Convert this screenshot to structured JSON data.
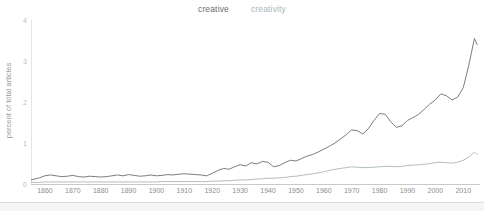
{
  "legend": {
    "position": "top-center",
    "items": [
      {
        "label": "creative",
        "color": "#6e6e6e"
      },
      {
        "label": "creativity",
        "color": "#a8b5b8"
      }
    ]
  },
  "axes": {
    "ylabel": "percent of total articles",
    "xlabel": "",
    "yticks": [
      "0",
      "1",
      "2",
      "3",
      "4"
    ],
    "xticks": [
      "1860",
      "1870",
      "1880",
      "1890",
      "1900",
      "1910",
      "1920",
      "1930",
      "1940",
      "1950",
      "1960",
      "1970",
      "1980",
      "1990",
      "2000",
      "2010"
    ]
  },
  "colors": {
    "creative": "#6e6e6e",
    "creativity": "#a8b5b8",
    "axis": "#c9c9c9",
    "gridline": "#e4e4e4",
    "tick_text": "#8d8d8d",
    "background": "#ffffff"
  },
  "chart_data": {
    "type": "line",
    "title": "",
    "xlabel": "",
    "ylabel": "percent of total articles",
    "xlim": [
      1855,
      2016
    ],
    "ylim": [
      0,
      4
    ],
    "grid": false,
    "legend_position": "top-center",
    "x": [
      1855,
      1858,
      1860,
      1862,
      1864,
      1866,
      1868,
      1870,
      1872,
      1874,
      1876,
      1878,
      1880,
      1882,
      1884,
      1886,
      1888,
      1890,
      1892,
      1894,
      1896,
      1898,
      1900,
      1902,
      1904,
      1906,
      1908,
      1910,
      1912,
      1914,
      1916,
      1918,
      1920,
      1922,
      1924,
      1926,
      1928,
      1930,
      1932,
      1934,
      1936,
      1938,
      1940,
      1942,
      1944,
      1946,
      1948,
      1950,
      1952,
      1954,
      1956,
      1958,
      1960,
      1962,
      1964,
      1966,
      1968,
      1970,
      1972,
      1974,
      1976,
      1978,
      1980,
      1982,
      1984,
      1986,
      1988,
      1990,
      1992,
      1994,
      1996,
      1998,
      2000,
      2002,
      2004,
      2006,
      2008,
      2010,
      2012,
      2014,
      2015
    ],
    "series": [
      {
        "name": "creative",
        "color": "#6e6e6e",
        "values": [
          0.1,
          0.15,
          0.2,
          0.22,
          0.2,
          0.18,
          0.19,
          0.21,
          0.18,
          0.17,
          0.19,
          0.18,
          0.17,
          0.18,
          0.2,
          0.22,
          0.2,
          0.23,
          0.21,
          0.19,
          0.2,
          0.22,
          0.2,
          0.21,
          0.23,
          0.22,
          0.24,
          0.25,
          0.24,
          0.23,
          0.22,
          0.2,
          0.26,
          0.33,
          0.38,
          0.36,
          0.42,
          0.47,
          0.44,
          0.52,
          0.49,
          0.55,
          0.53,
          0.42,
          0.45,
          0.52,
          0.58,
          0.56,
          0.62,
          0.68,
          0.72,
          0.78,
          0.85,
          0.92,
          1.0,
          1.1,
          1.2,
          1.32,
          1.3,
          1.22,
          1.35,
          1.55,
          1.72,
          1.7,
          1.52,
          1.38,
          1.42,
          1.55,
          1.62,
          1.7,
          1.82,
          1.95,
          2.05,
          2.2,
          2.15,
          2.05,
          2.12,
          2.35,
          2.9,
          3.55,
          3.4
        ]
      },
      {
        "name": "creativity",
        "color": "#a8b5b8",
        "values": [
          0.04,
          0.04,
          0.05,
          0.05,
          0.05,
          0.05,
          0.05,
          0.05,
          0.05,
          0.05,
          0.05,
          0.05,
          0.05,
          0.05,
          0.05,
          0.05,
          0.05,
          0.05,
          0.05,
          0.05,
          0.05,
          0.05,
          0.05,
          0.06,
          0.06,
          0.06,
          0.06,
          0.06,
          0.06,
          0.06,
          0.06,
          0.06,
          0.07,
          0.07,
          0.08,
          0.08,
          0.09,
          0.1,
          0.1,
          0.11,
          0.12,
          0.13,
          0.14,
          0.14,
          0.15,
          0.16,
          0.18,
          0.19,
          0.21,
          0.23,
          0.25,
          0.27,
          0.3,
          0.33,
          0.36,
          0.38,
          0.4,
          0.42,
          0.41,
          0.4,
          0.4,
          0.41,
          0.42,
          0.43,
          0.43,
          0.42,
          0.43,
          0.45,
          0.46,
          0.47,
          0.48,
          0.5,
          0.52,
          0.53,
          0.52,
          0.51,
          0.53,
          0.58,
          0.66,
          0.78,
          0.72
        ]
      }
    ]
  }
}
